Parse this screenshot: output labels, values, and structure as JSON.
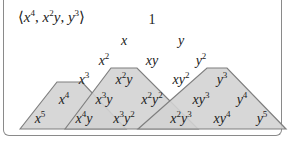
{
  "ideal": {
    "open": "⟨",
    "close": "⟩",
    "generators": [
      {
        "base": "x",
        "exp": "4"
      },
      {
        "base": "x",
        "exp": "2",
        "base2": "y",
        "exp2": ""
      },
      {
        "base": "y",
        "exp": "3"
      }
    ],
    "separator": ", "
  },
  "colors": {
    "shade_fill": "#d3d3d3",
    "shade_stroke": "#7f7f7f",
    "frame": "#8a8a8a",
    "text": "#222222"
  },
  "monomials": [
    {
      "id": "1",
      "a": "1",
      "ae": "",
      "b": "",
      "be": "",
      "x": 152,
      "y": 20
    },
    {
      "id": "x",
      "a": "x",
      "ae": "",
      "b": "",
      "be": "",
      "x": 124,
      "y": 41
    },
    {
      "id": "y",
      "a": "y",
      "ae": "",
      "b": "",
      "be": "",
      "x": 181,
      "y": 41
    },
    {
      "id": "x2",
      "a": "x",
      "ae": "2",
      "b": "",
      "be": "",
      "x": 104,
      "y": 61
    },
    {
      "id": "xy",
      "a": "x",
      "ae": "",
      "b": "y",
      "be": "",
      "x": 152,
      "y": 61
    },
    {
      "id": "y2",
      "a": "y",
      "ae": "2",
      "b": "",
      "be": "",
      "x": 201,
      "y": 61
    },
    {
      "id": "x3",
      "a": "x",
      "ae": "3",
      "b": "",
      "be": "",
      "x": 84,
      "y": 80
    },
    {
      "id": "x2y",
      "a": "x",
      "ae": "2",
      "b": "y",
      "be": "",
      "x": 124,
      "y": 80
    },
    {
      "id": "xy2",
      "a": "x",
      "ae": "",
      "b": "y",
      "be": "2",
      "x": 181,
      "y": 80
    },
    {
      "id": "y3",
      "a": "y",
      "ae": "3",
      "b": "",
      "be": "",
      "x": 222,
      "y": 80
    },
    {
      "id": "x4",
      "a": "x",
      "ae": "4",
      "b": "",
      "be": "",
      "x": 64,
      "y": 100
    },
    {
      "id": "x3y",
      "a": "x",
      "ae": "3",
      "b": "y",
      "be": "",
      "x": 104,
      "y": 100
    },
    {
      "id": "x2y2",
      "a": "x",
      "ae": "2",
      "b": "y",
      "be": "2",
      "x": 152,
      "y": 100
    },
    {
      "id": "xy3",
      "a": "x",
      "ae": "",
      "b": "y",
      "be": "3",
      "x": 201,
      "y": 100
    },
    {
      "id": "y4",
      "a": "y",
      "ae": "4",
      "b": "",
      "be": "",
      "x": 242,
      "y": 100
    },
    {
      "id": "x5",
      "a": "x",
      "ae": "5",
      "b": "",
      "be": "",
      "x": 40,
      "y": 119
    },
    {
      "id": "x4y",
      "a": "x",
      "ae": "4",
      "b": "y",
      "be": "",
      "x": 84,
      "y": 119
    },
    {
      "id": "x3y2",
      "a": "x",
      "ae": "3",
      "b": "y",
      "be": "2",
      "x": 124,
      "y": 119
    },
    {
      "id": "x2y3",
      "a": "x",
      "ae": "2",
      "b": "y",
      "be": "3",
      "x": 181,
      "y": 119
    },
    {
      "id": "xy4",
      "a": "x",
      "ae": "",
      "b": "y",
      "be": "4",
      "x": 222,
      "y": 119
    },
    {
      "id": "y5",
      "a": "y",
      "ae": "5",
      "b": "",
      "be": "",
      "x": 262,
      "y": 119
    }
  ],
  "regions": [
    {
      "generator": "x^4",
      "points": "20,129 57,82 82,82 126,129"
    },
    {
      "generator": "x^2y",
      "points": "65,129 111,68 137,68 198,129"
    },
    {
      "generator": "y^3",
      "points": "138,129 207,68 227,68 286,129"
    }
  ]
}
